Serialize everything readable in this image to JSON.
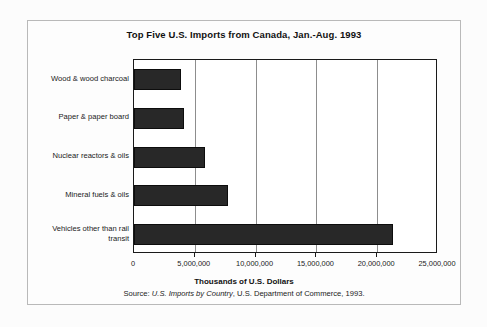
{
  "chart_data": {
    "type": "bar",
    "orientation": "horizontal",
    "title": "Top Five U.S. Imports from Canada, Jan.-Aug. 1993",
    "xlabel": "Thousands of U.S. Dollars",
    "ylabel": "",
    "xlim": [
      0,
      25000000
    ],
    "xticks": [
      0,
      5000000,
      10000000,
      15000000,
      20000000,
      25000000
    ],
    "xtick_labels": [
      "0",
      "5,000,000",
      "10,000,000",
      "15,000,000",
      "20,000,000",
      "25,000,000"
    ],
    "grid": "vertical",
    "legend": "none",
    "bar_color": "#282828",
    "categories": [
      "Wood & wood charcoal",
      "Paper & paper board",
      "Nuclear reactors & oils",
      "Mineral fuels & oils",
      "Vehicles other than rail transit"
    ],
    "values": [
      3900000,
      4100000,
      5800000,
      7700000,
      21300000
    ],
    "source_prefix": "Source: ",
    "source_italic": "U.S. Imports by Country",
    "source_suffix": ", U.S. Department of Commerce, 1993."
  },
  "figure": {
    "title": "Top Five U.S. Imports from Canada, Jan.-Aug. 1993",
    "x_axis_title": "Thousands of U.S. Dollars",
    "source_prefix": "Source: ",
    "source_italic": "U.S. Imports by Country",
    "source_suffix": ", U.S. Department of Commerce, 1993."
  },
  "category_labels": [
    {
      "line1": "Wood & wood charcoal",
      "line2": ""
    },
    {
      "line1": "Paper & paper board",
      "line2": ""
    },
    {
      "line1": "Nuclear reactors & oils",
      "line2": ""
    },
    {
      "line1": "Mineral fuels & oils",
      "line2": ""
    },
    {
      "line1": "Vehicles other than rail",
      "line2": "transit"
    }
  ]
}
